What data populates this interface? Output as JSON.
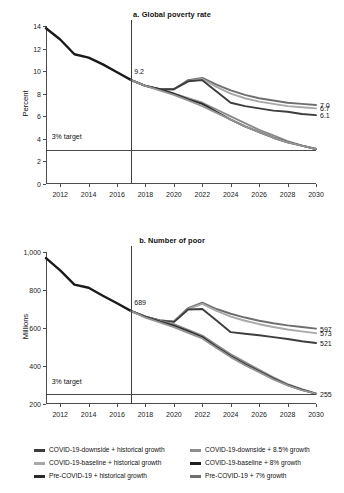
{
  "chart_data": [
    {
      "type": "line",
      "id": "global-poverty-rate",
      "title": "a. Global poverty rate",
      "xlabel": "",
      "ylabel": "Percent",
      "ylim": [
        0,
        14
      ],
      "yticks": [
        "0",
        "2",
        "4",
        "6",
        "8",
        "10",
        "12",
        "14"
      ],
      "ytick_values": [
        0,
        2,
        4,
        6,
        8,
        10,
        12,
        14
      ],
      "xlim": [
        2011,
        2030
      ],
      "xticks": [
        "2012",
        "2014",
        "2016",
        "2018",
        "2020",
        "2022",
        "2024",
        "2026",
        "2028",
        "2030"
      ],
      "xtick_values": [
        2012,
        2014,
        2016,
        2018,
        2020,
        2022,
        2024,
        2026,
        2028,
        2030
      ],
      "grid": false,
      "legend_position": "bottom",
      "annotations": [
        {
          "name": "last-actual-value",
          "text": "9.2",
          "x": 2017,
          "y": 9.2
        },
        {
          "name": "target-label",
          "text": "3% target",
          "x": 2011.4,
          "y": 3.6
        }
      ],
      "reference_lines": [
        {
          "name": "target-line",
          "orientation": "horizontal",
          "value": 3,
          "label": "3% target"
        },
        {
          "name": "forecast-divider",
          "orientation": "vertical",
          "value": 2017
        }
      ],
      "end_labels": [
        {
          "text": "7.0",
          "value": 7.0,
          "series": "COVID-19-downside + historical growth"
        },
        {
          "text": "6.7",
          "value": 6.7,
          "series": "COVID-19-baseline + historical growth"
        },
        {
          "text": "6.1",
          "value": 6.1,
          "series": "Pre-COVID-19 + historical growth"
        }
      ],
      "x": [
        2011,
        2012,
        2013,
        2014,
        2015,
        2016,
        2017,
        2018,
        2019,
        2020,
        2021,
        2022,
        2023,
        2024,
        2025,
        2026,
        2027,
        2028,
        2029,
        2030
      ],
      "series": [
        {
          "name": "Historical",
          "color": "#1a1a1a",
          "values": [
            13.8,
            12.8,
            11.5,
            11.2,
            10.6,
            9.9,
            9.2,
            null,
            null,
            null,
            null,
            null,
            null,
            null,
            null,
            null,
            null,
            null,
            null,
            null
          ]
        },
        {
          "name": "COVID-19-downside + historical growth",
          "color": "#6e6e6e",
          "values": [
            null,
            null,
            null,
            null,
            null,
            null,
            9.2,
            8.7,
            8.4,
            8.4,
            9.2,
            9.4,
            8.8,
            8.3,
            7.9,
            7.6,
            7.4,
            7.2,
            7.1,
            7.0
          ]
        },
        {
          "name": "COVID-19-baseline + historical growth",
          "color": "#a8a8a8",
          "values": [
            null,
            null,
            null,
            null,
            null,
            null,
            9.2,
            8.7,
            8.4,
            8.4,
            9.1,
            9.3,
            8.6,
            8.0,
            7.6,
            7.3,
            7.1,
            6.9,
            6.8,
            6.7
          ]
        },
        {
          "name": "Pre-COVID-19 + historical growth",
          "color": "#3d3d3d",
          "values": [
            null,
            null,
            null,
            null,
            null,
            null,
            9.2,
            8.7,
            8.4,
            8.4,
            9.1,
            9.2,
            8.2,
            7.2,
            6.9,
            6.7,
            6.5,
            6.4,
            6.2,
            6.1
          ]
        },
        {
          "name": "COVID-19-downside + 8.5% growth",
          "color": "#8a8a8a",
          "values": [
            null,
            null,
            null,
            null,
            null,
            null,
            9.2,
            8.7,
            8.4,
            8.0,
            7.6,
            7.2,
            6.6,
            6.0,
            5.4,
            4.8,
            4.3,
            3.8,
            3.4,
            3.1
          ]
        },
        {
          "name": "COVID-19-baseline + 8% growth",
          "color": "#2b2b2b",
          "values": [
            null,
            null,
            null,
            null,
            null,
            null,
            9.2,
            8.7,
            8.4,
            8.0,
            7.5,
            7.1,
            6.4,
            5.7,
            5.1,
            4.6,
            4.1,
            3.7,
            3.4,
            3.1
          ]
        },
        {
          "name": "Pre-COVID-19 + 7% growth",
          "color": "#949494",
          "values": [
            null,
            null,
            null,
            null,
            null,
            null,
            9.2,
            8.7,
            8.3,
            7.9,
            7.4,
            6.9,
            6.3,
            5.7,
            5.1,
            4.6,
            4.1,
            3.7,
            3.4,
            3.1
          ]
        }
      ]
    },
    {
      "type": "line",
      "id": "number-of-poor",
      "title": "b. Number of poor",
      "xlabel": "",
      "ylabel": "Millions",
      "ylim": [
        200,
        1000
      ],
      "yticks": [
        "200",
        "400",
        "600",
        "800",
        "1,000"
      ],
      "ytick_values": [
        200,
        400,
        600,
        800,
        1000
      ],
      "xlim": [
        2011,
        2030
      ],
      "xticks": [
        "2012",
        "2014",
        "2016",
        "2018",
        "2020",
        "2022",
        "2024",
        "2026",
        "2028",
        "2030"
      ],
      "xtick_values": [
        2012,
        2014,
        2016,
        2018,
        2020,
        2022,
        2024,
        2026,
        2028,
        2030
      ],
      "grid": false,
      "legend_position": "bottom",
      "annotations": [
        {
          "name": "last-actual-value",
          "text": "689",
          "x": 2017,
          "y": 689
        },
        {
          "name": "target-label",
          "text": "3% target",
          "x": 2011.4,
          "y": 285
        }
      ],
      "reference_lines": [
        {
          "name": "target-line",
          "orientation": "horizontal",
          "value": 255,
          "label": "3% target"
        },
        {
          "name": "forecast-divider",
          "orientation": "vertical",
          "value": 2017
        }
      ],
      "end_labels": [
        {
          "text": "597",
          "value": 597,
          "series": "COVID-19-downside + historical growth"
        },
        {
          "text": "573",
          "value": 573,
          "series": "COVID-19-baseline + historical growth"
        },
        {
          "text": "521",
          "value": 521,
          "series": "Pre-COVID-19 + historical growth"
        },
        {
          "text": "255",
          "value": 255,
          "series": "Pre-COVID-19 + 7% growth"
        }
      ],
      "x": [
        2011,
        2012,
        2013,
        2014,
        2015,
        2016,
        2017,
        2018,
        2019,
        2020,
        2021,
        2022,
        2023,
        2024,
        2025,
        2026,
        2027,
        2028,
        2029,
        2030
      ],
      "series": [
        {
          "name": "Historical",
          "color": "#1a1a1a",
          "values": [
            968,
            903,
            828,
            812,
            770,
            730,
            689,
            null,
            null,
            null,
            null,
            null,
            null,
            null,
            null,
            null,
            null,
            null,
            null,
            null
          ]
        },
        {
          "name": "COVID-19-downside + historical growth",
          "color": "#6e6e6e",
          "values": [
            null,
            null,
            null,
            null,
            null,
            null,
            689,
            660,
            640,
            635,
            705,
            733,
            700,
            675,
            655,
            638,
            625,
            614,
            605,
            597
          ]
        },
        {
          "name": "COVID-19-baseline + historical growth",
          "color": "#a8a8a8",
          "values": [
            null,
            null,
            null,
            null,
            null,
            null,
            689,
            660,
            640,
            635,
            700,
            727,
            690,
            660,
            638,
            620,
            605,
            592,
            582,
            573
          ]
        },
        {
          "name": "Pre-COVID-19 + historical growth",
          "color": "#3d3d3d",
          "values": [
            null,
            null,
            null,
            null,
            null,
            null,
            689,
            660,
            640,
            632,
            697,
            700,
            640,
            578,
            570,
            562,
            552,
            542,
            530,
            521
          ]
        },
        {
          "name": "COVID-19-downside + 8.5% growth",
          "color": "#8a8a8a",
          "values": [
            null,
            null,
            null,
            null,
            null,
            null,
            689,
            660,
            638,
            620,
            590,
            560,
            510,
            462,
            420,
            380,
            340,
            305,
            278,
            255
          ]
        },
        {
          "name": "COVID-19-baseline + 8% growth",
          "color": "#2b2b2b",
          "values": [
            null,
            null,
            null,
            null,
            null,
            null,
            689,
            658,
            635,
            612,
            583,
            552,
            500,
            452,
            410,
            372,
            334,
            300,
            275,
            255
          ]
        },
        {
          "name": "Pre-COVID-19 + 7% growth",
          "color": "#949494",
          "values": [
            null,
            null,
            null,
            null,
            null,
            null,
            689,
            655,
            630,
            605,
            575,
            545,
            495,
            447,
            405,
            368,
            330,
            298,
            273,
            255
          ]
        }
      ]
    }
  ],
  "legend": {
    "columns": [
      {
        "items": [
          {
            "label": "COVID-19-downside + historical growth",
            "color": "#3d3d3d"
          },
          {
            "label": "COVID-19-baseline + historical growth",
            "color": "#a8a8a8"
          },
          {
            "label": "Pre-COVID-19 + historical growth",
            "color": "#2b2b2b"
          }
        ]
      },
      {
        "items": [
          {
            "label": "COVID-19-downside + 8.5% growth",
            "color": "#8f8f8f"
          },
          {
            "label": "COVID-19-baseline + 8% growth",
            "color": "#1f1f1f"
          },
          {
            "label": "Pre-COVID-19 + 7% growth",
            "color": "#6e6e6e"
          }
        ]
      }
    ]
  }
}
